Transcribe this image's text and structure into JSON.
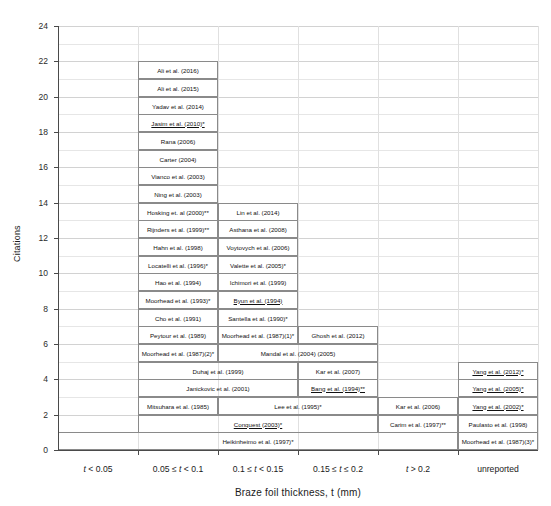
{
  "chart_data": {
    "type": "table",
    "title": "",
    "xlabel": "Braze foil thickness, t (mm)",
    "ylabel": "Citations",
    "ylim": [
      0,
      24
    ],
    "ytick_step": 2,
    "yminor_step": 1,
    "grid": true,
    "categories": [
      "t < 0.05",
      "0.05 ≤ t < 0.1",
      "0.1 ≤ t < 0.15",
      "0.15 ≤ t ≤ 0.2",
      "t > 0.2",
      "unreported"
    ],
    "ytick_labels": [
      "0",
      "2",
      "4",
      "6",
      "8",
      "10",
      "12",
      "14",
      "16",
      "18",
      "20",
      "22",
      "24"
    ],
    "note": "Each stacked box is one citation (1 unit tall); boxes span one or more thickness columns.",
    "cells": [
      {
        "label": "Ali et al. (2016)",
        "col": 2,
        "span": 1,
        "y": 21,
        "underline": false
      },
      {
        "label": "Ali et al. (2015)",
        "col": 2,
        "span": 1,
        "y": 20,
        "underline": false
      },
      {
        "label": "Yadav et al. (2014)",
        "col": 2,
        "span": 1,
        "y": 19,
        "underline": false
      },
      {
        "label": "Jasim et al. (2010)*",
        "col": 2,
        "span": 1,
        "y": 18,
        "underline": true
      },
      {
        "label": "Rana (2006)",
        "col": 2,
        "span": 1,
        "y": 17,
        "underline": false
      },
      {
        "label": "Carter (2004)",
        "col": 2,
        "span": 1,
        "y": 16,
        "underline": false
      },
      {
        "label": "Vianco et al. (2003)",
        "col": 2,
        "span": 1,
        "y": 15,
        "underline": false
      },
      {
        "label": "Ning et al. (2003)",
        "col": 2,
        "span": 1,
        "y": 14,
        "underline": false
      },
      {
        "label": "Hosking et. al (2000)**",
        "col": 2,
        "span": 1,
        "y": 13,
        "underline": false
      },
      {
        "label": "Lin et al. (2014)",
        "col": 3,
        "span": 1,
        "y": 13,
        "underline": false
      },
      {
        "label": "Rijnders et al. (1999)**",
        "col": 2,
        "span": 1,
        "y": 12,
        "underline": false
      },
      {
        "label": "Asthana et al. (2008)",
        "col": 3,
        "span": 1,
        "y": 12,
        "underline": false
      },
      {
        "label": "Hahn et al. (1998)",
        "col": 2,
        "span": 1,
        "y": 11,
        "underline": false
      },
      {
        "label": "Voytovych et al. (2006)",
        "col": 3,
        "span": 1,
        "y": 11,
        "underline": false
      },
      {
        "label": "Locatelli et al. (1996)*",
        "col": 2,
        "span": 1,
        "y": 10,
        "underline": false
      },
      {
        "label": "Valette et al. (2005)*",
        "col": 3,
        "span": 1,
        "y": 10,
        "underline": false
      },
      {
        "label": "Hao et al. (1994)",
        "col": 2,
        "span": 1,
        "y": 9,
        "underline": false
      },
      {
        "label": "Ichimori et al. (1999)",
        "col": 3,
        "span": 1,
        "y": 9,
        "underline": false
      },
      {
        "label": "Moorhead et al. (1993)*",
        "col": 2,
        "span": 1,
        "y": 8,
        "underline": false
      },
      {
        "label": "Byun et al. (1994)",
        "col": 3,
        "span": 1,
        "y": 8,
        "underline": true
      },
      {
        "label": "Cho et al. (1991)",
        "col": 2,
        "span": 1,
        "y": 7,
        "underline": false
      },
      {
        "label": "Santella et al. (1990)*",
        "col": 3,
        "span": 1,
        "y": 7,
        "underline": false
      },
      {
        "label": "Peytour et al. (1989)",
        "col": 2,
        "span": 1,
        "y": 6,
        "underline": false
      },
      {
        "label": "Moorhead et al. (1987)(1)*",
        "col": 3,
        "span": 1,
        "y": 6,
        "underline": false
      },
      {
        "label": "Ghosh et al. (2012)",
        "col": 4,
        "span": 1,
        "y": 6,
        "underline": false
      },
      {
        "label": "Moorhead et al. (1987)(2)*",
        "col": 2,
        "span": 1,
        "y": 5,
        "underline": false
      },
      {
        "label": "Mandal et al. (2004) (2005)",
        "col": 3,
        "span": 2,
        "y": 5,
        "underline": false
      },
      {
        "label": "Duhaj et al. (1999)",
        "col": 2,
        "span": 2,
        "y": 4,
        "underline": false
      },
      {
        "label": "Kar et al. (2007)",
        "col": 4,
        "span": 1,
        "y": 4,
        "underline": false
      },
      {
        "label": "Yang et al. (2012)*",
        "col": 6,
        "span": 1,
        "y": 4,
        "underline": true
      },
      {
        "label": "Janickovic et al. (2001)",
        "col": 2,
        "span": 2,
        "y": 3,
        "underline": false
      },
      {
        "label": "Bang et al. (1994)**",
        "col": 4,
        "span": 1,
        "y": 3,
        "underline": true
      },
      {
        "label": "Yang et al. (2005)*",
        "col": 6,
        "span": 1,
        "y": 3,
        "underline": true
      },
      {
        "label": "Mitsuhara et al. (1985)",
        "col": 2,
        "span": 1,
        "y": 2,
        "underline": false
      },
      {
        "label": "Lee et al. (1995)*",
        "col": 3,
        "span": 2,
        "y": 2,
        "underline": false
      },
      {
        "label": "Kar et al. (2006)",
        "col": 5,
        "span": 1,
        "y": 2,
        "underline": false
      },
      {
        "label": "Yang et al. (2002)*",
        "col": 6,
        "span": 1,
        "y": 2,
        "underline": true
      },
      {
        "label": "Conquest (2003)*",
        "col": 2,
        "span": 3,
        "y": 1,
        "underline": true
      },
      {
        "label": "Carim et al. (1997)**",
        "col": 5,
        "span": 1,
        "y": 1,
        "underline": false
      },
      {
        "label": "Paulasto et al. (1998)",
        "col": 6,
        "span": 1,
        "y": 1,
        "underline": false
      },
      {
        "label": "Heikinheimo et al. (1997)*",
        "col": 1,
        "span": 5,
        "y": 0,
        "underline": false
      },
      {
        "label": "Moorhead et al. (1987)(3)*",
        "col": 6,
        "span": 1,
        "y": 0,
        "underline": false
      }
    ]
  }
}
